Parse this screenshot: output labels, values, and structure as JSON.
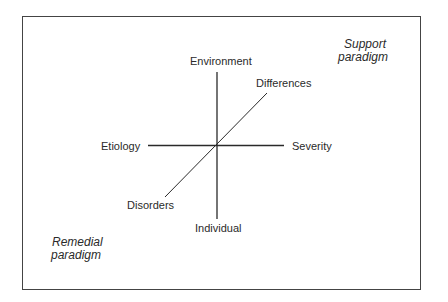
{
  "diagram": {
    "axes": {
      "vertical": {
        "top_label": "Environment",
        "bottom_label": "Individual"
      },
      "horizontal": {
        "left_label": "Etiology",
        "right_label": "Severity"
      },
      "diagonal": {
        "top_label": "Differences",
        "bottom_label": "Disorders"
      }
    },
    "corners": {
      "top_right": {
        "line1": "Support",
        "line2": "paradigm"
      },
      "bottom_left": {
        "line1": "Remedial",
        "line2": "paradigm"
      }
    },
    "colors": {
      "line": "#2a2a2a",
      "frame": "#444444",
      "background": "#ffffff"
    }
  }
}
